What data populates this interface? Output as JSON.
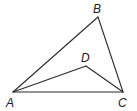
{
  "diagram": {
    "type": "geometry-figure",
    "points": [
      {
        "name": "A",
        "x": 13,
        "y": 92,
        "label_x": 6,
        "label_y": 107
      },
      {
        "name": "B",
        "x": 98,
        "y": 17,
        "label_x": 93,
        "label_y": 13
      },
      {
        "name": "C",
        "x": 123,
        "y": 92,
        "label_x": 118,
        "label_y": 107
      },
      {
        "name": "D",
        "x": 86,
        "y": 66,
        "label_x": 81,
        "label_y": 62
      }
    ],
    "segments": [
      [
        "A",
        "B"
      ],
      [
        "B",
        "C"
      ],
      [
        "A",
        "C"
      ],
      [
        "A",
        "D"
      ],
      [
        "D",
        "C"
      ]
    ],
    "labels": {
      "A": "A",
      "B": "B",
      "C": "C",
      "D": "D"
    },
    "colors": {
      "line": "#2a2a2a",
      "text": "#222222",
      "background": "#ffffff"
    }
  }
}
